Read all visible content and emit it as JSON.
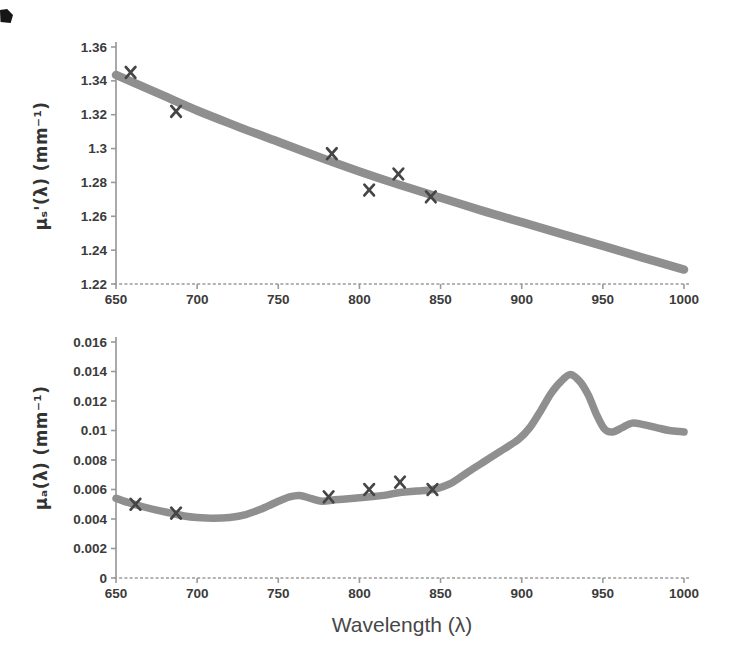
{
  "figure": {
    "background": "#ffffff",
    "curve_color": "#8f8f8f",
    "marker_color": "#454545",
    "axis_color": "#9a9a9a",
    "tick_color": "#3b3b3b"
  },
  "chart_data": [
    {
      "id": "scattering",
      "type": "line",
      "title": "",
      "xlabel": "",
      "ylabel": "μₛ'(λ) (mm⁻¹)",
      "xlim": [
        650,
        1000
      ],
      "ylim": [
        1.22,
        1.36
      ],
      "x_ticks": [
        650,
        700,
        750,
        800,
        850,
        900,
        950,
        1000
      ],
      "x_tick_labels": [
        "650",
        "700",
        "750",
        "800",
        "850",
        "900",
        "950",
        "1000"
      ],
      "y_ticks": [
        1.36,
        1.34,
        1.32,
        1.3,
        1.28,
        1.26,
        1.24,
        1.22
      ],
      "y_tick_labels": [
        "1.36",
        "1.34",
        "1.32",
        "1.3",
        "1.28",
        "1.26",
        "1.24",
        "1.22"
      ],
      "grid": false,
      "legend": false,
      "series": [
        {
          "name": "fitted reduced scattering curve",
          "type": "line",
          "x": [
            650,
            675,
            700,
            725,
            750,
            775,
            800,
            825,
            850,
            875,
            900,
            925,
            950,
            975,
            1000
          ],
          "y": [
            1.3435,
            1.333,
            1.3225,
            1.313,
            1.304,
            1.295,
            1.2865,
            1.2785,
            1.271,
            1.2635,
            1.2565,
            1.2495,
            1.2425,
            1.2355,
            1.2285
          ]
        },
        {
          "name": "measured points",
          "type": "scatter",
          "marker": "x",
          "x": [
            659,
            687,
            783,
            806,
            824,
            844
          ],
          "y": [
            1.345,
            1.322,
            1.297,
            1.2755,
            1.285,
            1.2715
          ]
        }
      ]
    },
    {
      "id": "absorption",
      "type": "line",
      "title": "",
      "xlabel": "Wavelength (λ)",
      "ylabel": "μₐ(λ) (mm⁻¹)",
      "xlim": [
        650,
        1000
      ],
      "ylim": [
        0,
        0.016
      ],
      "x_ticks": [
        650,
        700,
        750,
        800,
        850,
        900,
        950,
        1000
      ],
      "x_tick_labels": [
        "650",
        "700",
        "750",
        "800",
        "850",
        "900",
        "950",
        "1000"
      ],
      "y_ticks": [
        0.016,
        0.014,
        0.012,
        0.01,
        0.008,
        0.006,
        0.004,
        0.002,
        0
      ],
      "y_tick_labels": [
        "0.016",
        "0.014",
        "0.012",
        "0.01",
        "0.008",
        "0.006",
        "0.004",
        "0.002",
        "0"
      ],
      "grid": false,
      "legend": false,
      "series": [
        {
          "name": "absorption spectrum curve",
          "type": "line",
          "x": [
            650,
            658,
            666,
            675,
            684,
            692,
            700,
            710,
            720,
            730,
            740,
            750,
            757,
            763,
            770,
            777,
            785,
            795,
            805,
            815,
            825,
            835,
            845,
            856,
            867,
            877,
            887,
            898,
            905,
            912,
            918,
            924,
            930,
            936,
            941,
            946,
            951,
            956,
            962,
            968,
            975,
            983,
            991,
            1000
          ],
          "y": [
            0.0054,
            0.0051,
            0.00485,
            0.0046,
            0.0044,
            0.0042,
            0.0041,
            0.00405,
            0.0041,
            0.0043,
            0.0047,
            0.0052,
            0.0055,
            0.0056,
            0.0054,
            0.0052,
            0.0053,
            0.0054,
            0.0055,
            0.0056,
            0.0058,
            0.0059,
            0.006,
            0.0064,
            0.0072,
            0.0079,
            0.0086,
            0.0094,
            0.0102,
            0.0114,
            0.0125,
            0.0133,
            0.0138,
            0.0133,
            0.0124,
            0.0111,
            0.0101,
            0.0099,
            0.0102,
            0.0105,
            0.0104,
            0.0102,
            0.01,
            0.0099
          ]
        },
        {
          "name": "measured points",
          "type": "scatter",
          "marker": "x",
          "x": [
            662,
            687,
            781,
            806,
            825,
            845
          ],
          "y": [
            0.005,
            0.0044,
            0.0055,
            0.006,
            0.0065,
            0.006
          ]
        }
      ]
    }
  ]
}
